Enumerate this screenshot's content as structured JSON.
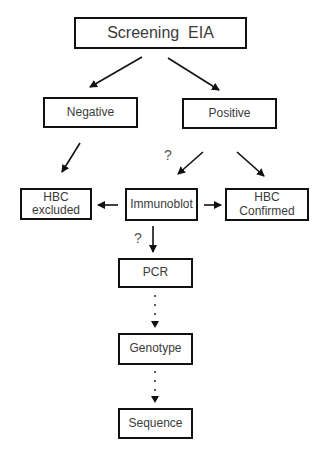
{
  "diagram": {
    "type": "flowchart",
    "nodes": {
      "screening": {
        "label": "Screening  EIA"
      },
      "negative": {
        "label": "Negative"
      },
      "positive": {
        "label": "Positive"
      },
      "hbc_excluded": {
        "line1": "HBC",
        "line2": "excluded"
      },
      "immunoblot": {
        "label": "Immunoblot"
      },
      "hbc_confirmed": {
        "line1": "HBC",
        "line2": "Confirmed"
      },
      "pcr": {
        "label": "PCR"
      },
      "genotype": {
        "label": "Genotype"
      },
      "sequence": {
        "label": "Sequence"
      }
    },
    "annotations": {
      "q_positive_to_immunoblot": "?",
      "q_immunoblot_to_pcr": "?"
    },
    "edges": [
      {
        "from": "screening",
        "to": "negative",
        "style": "solid"
      },
      {
        "from": "screening",
        "to": "positive",
        "style": "solid"
      },
      {
        "from": "negative",
        "to": "hbc_excluded",
        "style": "solid"
      },
      {
        "from": "positive",
        "to": "immunoblot",
        "style": "solid",
        "label": "?"
      },
      {
        "from": "positive",
        "to": "hbc_confirmed",
        "style": "solid"
      },
      {
        "from": "immunoblot",
        "to": "hbc_excluded",
        "style": "solid"
      },
      {
        "from": "immunoblot",
        "to": "hbc_confirmed",
        "style": "solid"
      },
      {
        "from": "immunoblot",
        "to": "pcr",
        "style": "solid",
        "label": "?"
      },
      {
        "from": "pcr",
        "to": "genotype",
        "style": "dotted"
      },
      {
        "from": "genotype",
        "to": "sequence",
        "style": "dotted"
      }
    ]
  }
}
